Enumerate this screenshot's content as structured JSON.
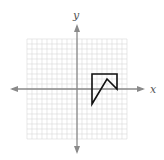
{
  "diagram": {
    "type": "coordinate-plane",
    "axes": {
      "x_label": "x",
      "y_label": "y",
      "range": [
        -10,
        10
      ],
      "grid_step": 1
    },
    "colors": {
      "grid": "#d9d9d9",
      "axis": "#8a8a8a",
      "shape": "#111111",
      "label": "#555555"
    },
    "figure": {
      "name": "polygon",
      "vertices": [
        [
          3,
          3
        ],
        [
          8,
          3
        ],
        [
          8,
          0
        ],
        [
          6,
          2
        ],
        [
          3,
          -3
        ]
      ]
    }
  }
}
